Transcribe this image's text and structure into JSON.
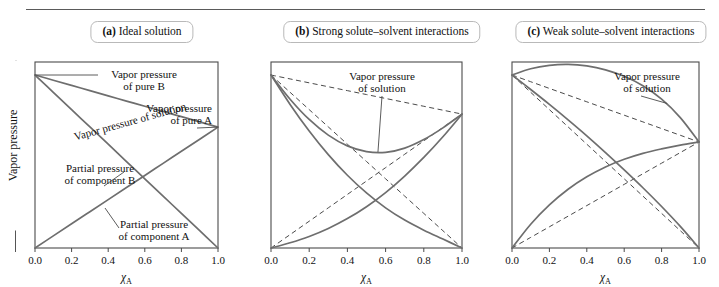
{
  "figure": {
    "y_axis_label": "Vapor pressure",
    "x_axis_label_symbol": "χ",
    "x_axis_label_sub": "A",
    "x_ticks": [
      "0.0",
      "0.2",
      "0.4",
      "0.6",
      "0.8",
      "1.0"
    ],
    "curve_color": "#6e6e6e",
    "ideal_color": "#4a4a4a",
    "axis_color": "#4b4b4b"
  },
  "panels": [
    {
      "id": "a",
      "tag": "(a)",
      "title": "Ideal solution",
      "annotations": [
        {
          "name": "vapor-pressure-pure-b",
          "line1": "Vapor pressure",
          "line2": "of pure B"
        },
        {
          "name": "vapor-pressure-pure-a",
          "line1": "Vapor pressure",
          "line2": "of pure A"
        },
        {
          "name": "vapor-pressure-solution",
          "line1": "Vapor pressure of solution",
          "line2": ""
        },
        {
          "name": "partial-pressure-component-b",
          "line1": "Partial pressure",
          "line2": "of component B"
        },
        {
          "name": "partial-pressure-component-a",
          "line1": "Partial pressure",
          "line2": "of component A"
        }
      ]
    },
    {
      "id": "b",
      "tag": "(b)",
      "title": "Strong solute–solvent interactions",
      "annotations": [
        {
          "name": "vapor-pressure-solution",
          "line1": "Vapor pressure",
          "line2": "of solution"
        }
      ]
    },
    {
      "id": "c",
      "tag": "(c)",
      "title": "Weak solute–solvent interactions",
      "annotations": [
        {
          "name": "vapor-pressure-solution",
          "line1": "Vapor pressure",
          "line2": "of solution"
        }
      ]
    }
  ],
  "chart_data": [
    {
      "panel": "a",
      "type": "line",
      "title": "(a) Ideal solution",
      "xlabel": "χA",
      "ylabel": "Vapor pressure",
      "xlim": [
        0.0,
        1.0
      ],
      "ylim": [
        0.0,
        1.0
      ],
      "grid": false,
      "legend": "none",
      "x": [
        0.0,
        0.1,
        0.2,
        0.3,
        0.4,
        0.5,
        0.6,
        0.7,
        0.8,
        0.9,
        1.0
      ],
      "series": [
        {
          "name": "Partial pressure of component A",
          "style": "solid",
          "values": [
            0.0,
            0.065,
            0.13,
            0.195,
            0.26,
            0.325,
            0.39,
            0.455,
            0.52,
            0.585,
            0.65
          ]
        },
        {
          "name": "Partial pressure of component B",
          "style": "solid",
          "values": [
            0.93,
            0.837,
            0.744,
            0.651,
            0.558,
            0.465,
            0.372,
            0.279,
            0.186,
            0.093,
            0.0
          ]
        },
        {
          "name": "Vapor pressure of solution",
          "style": "solid",
          "values": [
            0.93,
            0.902,
            0.874,
            0.846,
            0.818,
            0.79,
            0.762,
            0.734,
            0.706,
            0.678,
            0.65
          ]
        }
      ]
    },
    {
      "panel": "b",
      "type": "line",
      "title": "(b) Strong solute–solvent interactions",
      "xlabel": "χA",
      "ylabel": "Vapor pressure",
      "xlim": [
        0.0,
        1.0
      ],
      "ylim": [
        0.0,
        1.0
      ],
      "grid": false,
      "legend": "none",
      "deviation": "negative",
      "x": [
        0.0,
        0.1,
        0.2,
        0.3,
        0.4,
        0.5,
        0.6,
        0.7,
        0.8,
        0.9,
        1.0
      ],
      "series": [
        {
          "name": "Raoult ideal partial pressure A",
          "style": "dashed",
          "values": [
            0.0,
            0.072,
            0.144,
            0.216,
            0.288,
            0.36,
            0.432,
            0.504,
            0.576,
            0.648,
            0.72
          ]
        },
        {
          "name": "Raoult ideal partial pressure B",
          "style": "dashed",
          "values": [
            0.93,
            0.837,
            0.744,
            0.651,
            0.558,
            0.465,
            0.372,
            0.279,
            0.186,
            0.093,
            0.0
          ]
        },
        {
          "name": "Raoult ideal total pressure",
          "style": "dashed",
          "values": [
            0.93,
            0.909,
            0.888,
            0.867,
            0.846,
            0.825,
            0.804,
            0.783,
            0.762,
            0.741,
            0.72
          ]
        },
        {
          "name": "Actual partial pressure A",
          "style": "solid",
          "values": [
            0.0,
            0.028,
            0.062,
            0.105,
            0.158,
            0.222,
            0.298,
            0.387,
            0.487,
            0.598,
            0.72
          ]
        },
        {
          "name": "Actual partial pressure B",
          "style": "solid",
          "values": [
            0.93,
            0.772,
            0.629,
            0.502,
            0.391,
            0.296,
            0.216,
            0.15,
            0.096,
            0.048,
            0.0
          ]
        },
        {
          "name": "Actual vapor pressure of solution",
          "style": "solid",
          "values": [
            0.93,
            0.8,
            0.691,
            0.607,
            0.549,
            0.518,
            0.514,
            0.537,
            0.583,
            0.646,
            0.72
          ]
        }
      ]
    },
    {
      "panel": "c",
      "type": "line",
      "title": "(c) Weak solute–solvent interactions",
      "xlabel": "χA",
      "ylabel": "Vapor pressure",
      "xlim": [
        0.0,
        1.0
      ],
      "ylim": [
        0.0,
        1.0
      ],
      "grid": false,
      "legend": "none",
      "deviation": "positive",
      "x": [
        0.0,
        0.1,
        0.2,
        0.3,
        0.4,
        0.5,
        0.6,
        0.7,
        0.8,
        0.9,
        1.0
      ],
      "series": [
        {
          "name": "Raoult ideal partial pressure A",
          "style": "dashed",
          "values": [
            0.0,
            0.057,
            0.114,
            0.171,
            0.228,
            0.285,
            0.342,
            0.399,
            0.456,
            0.513,
            0.57
          ]
        },
        {
          "name": "Raoult ideal partial pressure B",
          "style": "dashed",
          "values": [
            0.93,
            0.837,
            0.744,
            0.651,
            0.558,
            0.465,
            0.372,
            0.279,
            0.186,
            0.093,
            0.0
          ]
        },
        {
          "name": "Raoult ideal total pressure",
          "style": "dashed",
          "values": [
            0.93,
            0.894,
            0.858,
            0.822,
            0.786,
            0.75,
            0.714,
            0.678,
            0.642,
            0.606,
            0.57
          ]
        },
        {
          "name": "Actual partial pressure A",
          "style": "solid",
          "values": [
            0.0,
            0.128,
            0.232,
            0.316,
            0.383,
            0.436,
            0.477,
            0.509,
            0.533,
            0.553,
            0.57
          ]
        },
        {
          "name": "Actual partial pressure B",
          "style": "solid",
          "values": [
            0.93,
            0.852,
            0.772,
            0.689,
            0.603,
            0.513,
            0.42,
            0.324,
            0.223,
            0.116,
            0.0
          ]
        },
        {
          "name": "Actual vapor pressure of solution",
          "style": "solid",
          "values": [
            0.93,
            0.964,
            0.982,
            0.987,
            0.979,
            0.958,
            0.923,
            0.872,
            0.8,
            0.701,
            0.57
          ]
        }
      ]
    }
  ]
}
